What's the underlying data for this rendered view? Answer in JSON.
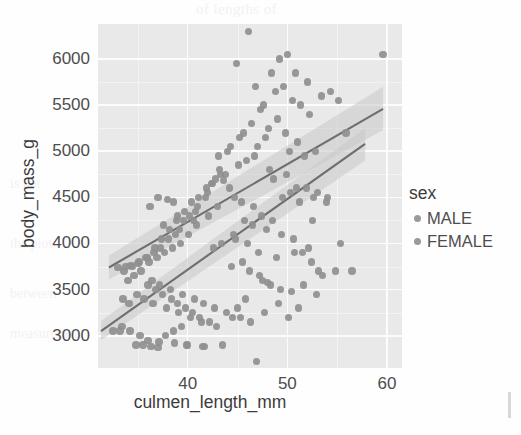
{
  "figure": {
    "background_color": "#fefefe",
    "panel_background_color": "#e9e9e9",
    "gridline_color": "#fcfcfc",
    "point_color": "#8f8f8f",
    "line_color": "#6e6e6e",
    "ribbon_color": "#c9c9c9"
  },
  "background_artifacts": {
    "top_text": "of lengths of",
    "mid_text": "is not",
    "low_text_1": "the plot",
    "low_text_2": "between",
    "low_text_3": "measurement"
  },
  "legend": {
    "title": "sex",
    "position": "right",
    "entries": [
      {
        "label": "MALE",
        "color": "#9a9a9a"
      },
      {
        "label": "FEMALE",
        "color": "#9a9a9a"
      }
    ]
  },
  "chart_data": {
    "type": "scatter",
    "title": "",
    "subtitle": "",
    "xlabel": "culmen_length_mm",
    "ylabel": "body_mass_g",
    "xlim": [
      31.0,
      61.5
    ],
    "ylim": [
      2650,
      6380
    ],
    "xticks": [
      40,
      50,
      60
    ],
    "xticklabels": [
      "40",
      "50",
      "60"
    ],
    "yticks": [
      3000,
      3500,
      4000,
      4500,
      5000,
      5500,
      6000
    ],
    "yticklabels": [
      "3000",
      "3500",
      "4000",
      "4500",
      "5000",
      "5500",
      "6000"
    ],
    "grid": true,
    "grid_major_x": [
      40,
      50,
      60
    ],
    "grid_minor_x": [
      35,
      45,
      55
    ],
    "grid_major_y": [
      3000,
      3500,
      4000,
      4500,
      5000,
      5500,
      6000
    ],
    "grid_minor_y": [
      3250,
      3750,
      4250,
      4750,
      5250,
      5750
    ],
    "legend_position": "right",
    "series": [
      {
        "name": "MALE",
        "marker": "circle",
        "color": "#8f8f8f",
        "fit": {
          "type": "linear",
          "x_start": 32.1,
          "y_start": 3740,
          "x_end": 59.6,
          "y_end": 5460,
          "band_lower_start": 3610,
          "band_upper_start": 3870,
          "band_lower_end": 5230,
          "band_upper_end": 5700
        },
        "points": [
          [
            46.1,
            6300
          ],
          [
            44.9,
            5950
          ],
          [
            49.2,
            6000
          ],
          [
            50.0,
            6050
          ],
          [
            59.6,
            6050
          ],
          [
            48.4,
            5850
          ],
          [
            50.8,
            5850
          ],
          [
            52.0,
            5750
          ],
          [
            53.4,
            5600
          ],
          [
            47.6,
            5500
          ],
          [
            46.8,
            5700
          ],
          [
            48.8,
            5650
          ],
          [
            49.6,
            5700
          ],
          [
            50.5,
            5550
          ],
          [
            51.3,
            5500
          ],
          [
            52.2,
            5400
          ],
          [
            45.2,
            5150
          ],
          [
            46.4,
            5300
          ],
          [
            47.3,
            5450
          ],
          [
            48.1,
            5250
          ],
          [
            49.0,
            5350
          ],
          [
            49.8,
            5200
          ],
          [
            50.2,
            5000
          ],
          [
            51.0,
            5100
          ],
          [
            51.7,
            4950
          ],
          [
            52.8,
            5000
          ],
          [
            54.3,
            5650
          ],
          [
            55.1,
            5550
          ],
          [
            55.9,
            5200
          ],
          [
            45.6,
            5200
          ],
          [
            44.0,
            5000
          ],
          [
            43.2,
            4800
          ],
          [
            42.5,
            4650
          ],
          [
            41.8,
            4500
          ],
          [
            41.0,
            4400
          ],
          [
            40.2,
            4300
          ],
          [
            39.6,
            4250
          ],
          [
            38.8,
            4100
          ],
          [
            38.1,
            4050
          ],
          [
            37.3,
            3950
          ],
          [
            36.6,
            3900
          ],
          [
            35.9,
            3850
          ],
          [
            35.1,
            3800
          ],
          [
            34.4,
            3750
          ],
          [
            33.6,
            3700
          ],
          [
            39.2,
            4150
          ],
          [
            40.8,
            4350
          ],
          [
            42.0,
            4550
          ],
          [
            43.8,
            4750
          ],
          [
            45.9,
            4900
          ],
          [
            47.0,
            5050
          ],
          [
            48.6,
            4700
          ],
          [
            50.9,
            4600
          ],
          [
            52.6,
            4500
          ],
          [
            53.9,
            4450
          ],
          [
            46.5,
            4200
          ],
          [
            47.9,
            4150
          ],
          [
            49.4,
            4100
          ],
          [
            50.6,
            4050
          ],
          [
            51.5,
            3900
          ],
          [
            52.4,
            3800
          ],
          [
            53.1,
            3700
          ],
          [
            54.8,
            3700
          ],
          [
            56.5,
            3700
          ],
          [
            55.3,
            4000
          ],
          [
            36.0,
            3550
          ],
          [
            36.8,
            3500
          ],
          [
            37.5,
            3450
          ],
          [
            38.4,
            3400
          ],
          [
            39.0,
            3350
          ],
          [
            39.8,
            3300
          ],
          [
            40.5,
            3250
          ],
          [
            41.2,
            3200
          ],
          [
            42.2,
            3150
          ],
          [
            34.0,
            3600
          ],
          [
            33.2,
            3050
          ],
          [
            34.8,
            2900
          ],
          [
            35.5,
            2900
          ],
          [
            36.3,
            2880
          ],
          [
            37.0,
            2870
          ],
          [
            37.8,
            3000
          ],
          [
            38.6,
            3050
          ],
          [
            39.4,
            3100
          ],
          [
            40.0,
            2900
          ],
          [
            41.5,
            2880
          ],
          [
            43.5,
            2900
          ],
          [
            46.9,
            2720
          ],
          [
            44.5,
            3200
          ],
          [
            45.0,
            3300
          ],
          [
            45.8,
            3400
          ],
          [
            47.5,
            3600
          ],
          [
            48.3,
            3550
          ],
          [
            49.1,
            3350
          ],
          [
            50.1,
            3200
          ],
          [
            51.1,
            3300
          ],
          [
            52.9,
            3450
          ],
          [
            43.0,
            4400
          ],
          [
            36.2,
            4400
          ],
          [
            38.0,
            4480
          ],
          [
            37.6,
            4200
          ]
        ]
      },
      {
        "name": "FEMALE",
        "marker": "circle",
        "color": "#8f8f8f",
        "fit": {
          "type": "linear",
          "x_start": 31.3,
          "y_start": 3050,
          "x_end": 57.8,
          "y_end": 5080,
          "band_lower_start": 2950,
          "band_upper_start": 3160,
          "band_lower_end": 4900,
          "band_upper_end": 5250
        },
        "points": [
          [
            43.3,
            4750
          ],
          [
            42.8,
            4700
          ],
          [
            41.9,
            4600
          ],
          [
            41.1,
            4500
          ],
          [
            40.4,
            4450
          ],
          [
            39.7,
            4350
          ],
          [
            38.9,
            4250
          ],
          [
            38.2,
            4150
          ],
          [
            37.4,
            4050
          ],
          [
            36.7,
            3950
          ],
          [
            35.8,
            3850
          ],
          [
            35.0,
            3780
          ],
          [
            34.3,
            3760
          ],
          [
            33.8,
            3750
          ],
          [
            33.0,
            3740
          ],
          [
            42.4,
            4650
          ],
          [
            43.6,
            4680
          ],
          [
            44.2,
            4600
          ],
          [
            44.7,
            4500
          ],
          [
            45.4,
            4450
          ],
          [
            40.9,
            4200
          ],
          [
            40.1,
            4100
          ],
          [
            39.3,
            4000
          ],
          [
            38.5,
            3950
          ],
          [
            37.7,
            3900
          ],
          [
            36.9,
            3850
          ],
          [
            36.1,
            3800
          ],
          [
            35.3,
            3700
          ],
          [
            34.6,
            3650
          ],
          [
            36.4,
            3600
          ],
          [
            37.2,
            3550
          ],
          [
            38.3,
            3500
          ],
          [
            39.5,
            3450
          ],
          [
            40.7,
            3400
          ],
          [
            41.6,
            3350
          ],
          [
            42.7,
            3300
          ],
          [
            43.9,
            3250
          ],
          [
            34.9,
            3450
          ],
          [
            35.6,
            3400
          ],
          [
            36.5,
            3350
          ],
          [
            37.9,
            3300
          ],
          [
            39.1,
            3250
          ],
          [
            40.3,
            3200
          ],
          [
            41.4,
            3150
          ],
          [
            42.9,
            3100
          ],
          [
            33.4,
            3100
          ],
          [
            34.2,
            3050
          ],
          [
            35.2,
            3000
          ],
          [
            36.0,
            2950
          ],
          [
            37.1,
            2930
          ],
          [
            38.7,
            2920
          ],
          [
            39.9,
            2900
          ],
          [
            41.7,
            2880
          ],
          [
            44.4,
            3750
          ],
          [
            45.5,
            3800
          ],
          [
            46.2,
            3700
          ],
          [
            47.2,
            3650
          ],
          [
            48.0,
            3580
          ],
          [
            49.3,
            3500
          ],
          [
            50.4,
            3480
          ],
          [
            51.6,
            3550
          ],
          [
            44.8,
            4050
          ],
          [
            46.0,
            4000
          ],
          [
            47.1,
            3900
          ],
          [
            48.9,
            3850
          ],
          [
            50.7,
            3900
          ],
          [
            52.1,
            3950
          ],
          [
            53.5,
            3650
          ],
          [
            43.1,
            4950
          ],
          [
            44.3,
            5050
          ],
          [
            45.1,
            4850
          ],
          [
            46.7,
            4950
          ],
          [
            47.8,
            5150
          ],
          [
            48.2,
            4800
          ],
          [
            49.9,
            4750
          ],
          [
            51.9,
            4600
          ],
          [
            53.0,
            4550
          ],
          [
            42.1,
            4300
          ],
          [
            40.6,
            4250
          ],
          [
            39.0,
            4300
          ],
          [
            38.6,
            4450
          ],
          [
            37.0,
            4500
          ],
          [
            42.6,
            3950
          ],
          [
            43.4,
            4000
          ],
          [
            44.6,
            4100
          ],
          [
            45.7,
            4250
          ],
          [
            46.6,
            4400
          ],
          [
            47.4,
            4300
          ],
          [
            48.5,
            4250
          ],
          [
            49.5,
            4500
          ],
          [
            50.3,
            4550
          ],
          [
            51.2,
            4450
          ],
          [
            52.5,
            4250
          ],
          [
            54.0,
            4500
          ],
          [
            33.5,
            3400
          ],
          [
            34.1,
            3350
          ],
          [
            32.5,
            3050
          ],
          [
            45.3,
            3200
          ],
          [
            46.3,
            3150
          ],
          [
            47.7,
            3250
          ]
        ]
      }
    ]
  }
}
